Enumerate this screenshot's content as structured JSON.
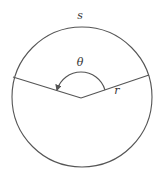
{
  "diagram": {
    "colors": {
      "background": "#ffffff",
      "stroke": "#555555",
      "text": "#333333"
    },
    "circle": {
      "cx": 82,
      "cy": 97,
      "r": 70
    },
    "center_vertex": {
      "x": 81,
      "y": 98
    },
    "radii": [
      {
        "name": "left-radius",
        "x2": 13,
        "y2": 77
      },
      {
        "name": "right-radius",
        "x2": 149,
        "y2": 75
      }
    ],
    "angle_arc": {
      "radius": 25,
      "start": {
        "x": 105,
        "y": 90
      },
      "end": {
        "x": 57,
        "y": 90
      },
      "has_arrowhead": true
    },
    "labels": {
      "arc_length": "s",
      "angle": "θ",
      "radius": "r"
    }
  }
}
